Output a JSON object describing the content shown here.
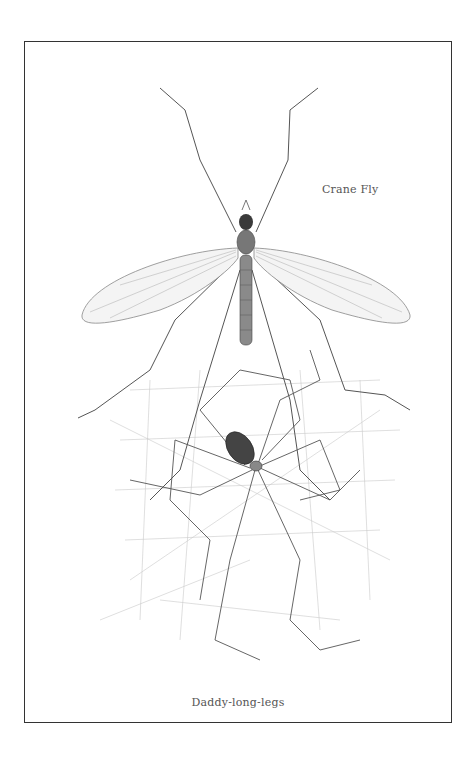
{
  "illustration": {
    "captions": {
      "crane_fly": "Crane Fly",
      "daddy_long_legs": "Daddy-long-legs"
    },
    "colors": {
      "frame": "#333333",
      "ink": "#555555",
      "body_dark": "#3a3a3a",
      "background": "#ffffff"
    }
  }
}
